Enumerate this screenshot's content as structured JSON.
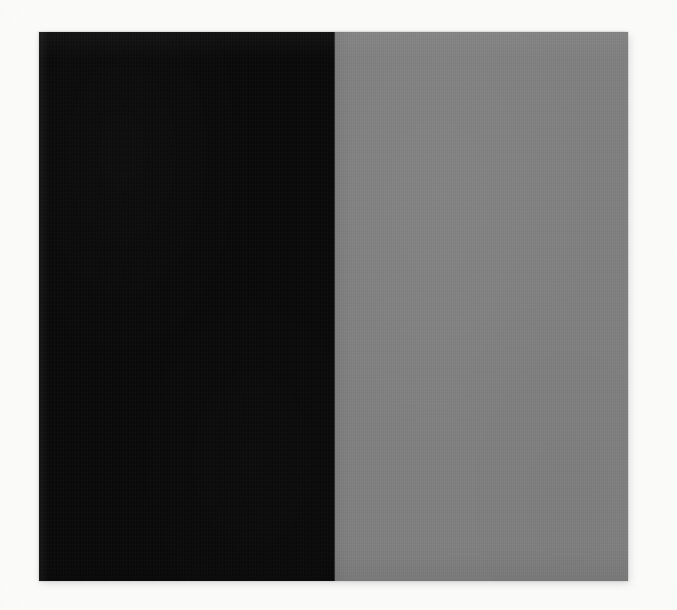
{
  "image": {
    "title": "Two-Tone Color Field",
    "kind": "natural-image",
    "width_px": 677,
    "height_px": 610,
    "background_color": "#fbfbfa",
    "description": "A photographed rectangular panel divided vertically into two flat color fields: a near-black left half and a medium gray right half, set on an off-white paper background."
  },
  "panel": {
    "label": "color-panel",
    "left_px": 39,
    "top_px": 32,
    "width_px": 589,
    "height_px": 549,
    "divider_x_px": 334,
    "divider_color": "#2e2e2e"
  },
  "fields": [
    {
      "name": "left-field",
      "tone": "near-black",
      "color": "#0b0a0a",
      "width_px": 295,
      "share_percent": 50
    },
    {
      "name": "right-field",
      "tone": "medium-gray",
      "color": "#808080",
      "width_px": 294,
      "share_percent": 50
    }
  ],
  "palette": {
    "dark": "#0b0a0a",
    "gray": "#808080",
    "paper": "#fbfbfa",
    "edge": "#2e2e2e"
  }
}
